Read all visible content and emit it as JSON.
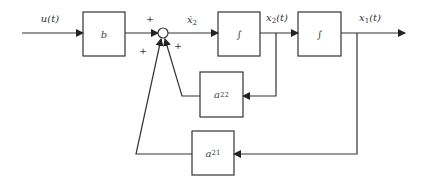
{
  "diagram": {
    "type": "block-diagram",
    "input_label": "u(t)",
    "blocks": [
      {
        "id": "b",
        "label": "b"
      },
      {
        "id": "int1",
        "label": "∫"
      },
      {
        "id": "int2",
        "label": "∫"
      },
      {
        "id": "a22",
        "label_main": "a",
        "label_sub": "22"
      },
      {
        "id": "a21",
        "label_main": "a",
        "label_sub": "21"
      }
    ],
    "signals": {
      "xdot2_main": "ẋ",
      "xdot2_sub": "2",
      "x2_main": "x",
      "x2_sub": "2",
      "x2_tail": "(t)",
      "x1_main": "x",
      "x1_sub": "1",
      "x1_tail": "(t)"
    },
    "summing_junction": {
      "signs": [
        "+",
        "+",
        "+"
      ]
    },
    "colors": {
      "line": "#333333",
      "background": "#ffffff"
    }
  }
}
